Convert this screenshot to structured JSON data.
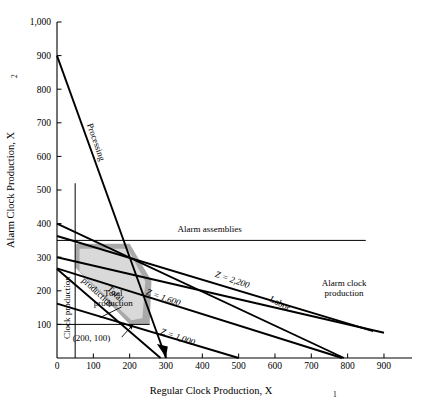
{
  "chart_data": {
    "type": "line",
    "title": "",
    "xlabel": "Regular Clock Production, X",
    "xlabel_sub": "1",
    "ylabel": "Alarm Clock Production, X",
    "ylabel_sub": "2",
    "xlim": [
      0,
      900
    ],
    "ylim": [
      0,
      1000
    ],
    "xticks": [
      "0",
      "100",
      "200",
      "300",
      "400",
      "500",
      "600",
      "700",
      "800",
      "900"
    ],
    "xtick_values": [
      0,
      100,
      200,
      300,
      400,
      500,
      600,
      700,
      800,
      900
    ],
    "yticks": [
      "100",
      "200",
      "300",
      "400",
      "500",
      "600",
      "700",
      "800",
      "900",
      "1,000"
    ],
    "ytick_values": [
      100,
      200,
      300,
      400,
      500,
      600,
      700,
      800,
      900,
      1000
    ],
    "grid": false,
    "legend": "none",
    "constraint_lines": [
      {
        "name": "processing",
        "label": "Processing",
        "points": [
          [
            0,
            900
          ],
          [
            300,
            0
          ]
        ],
        "label_x": 100,
        "label_y": 640,
        "rotation": 71,
        "style": "thick"
      },
      {
        "name": "alarm-assemblies",
        "label": "Alarm assemblies",
        "points": [
          [
            0,
            350
          ],
          [
            850,
            350
          ]
        ],
        "label_x": 420,
        "label_y": 375,
        "rotation": 0,
        "style": "thin"
      },
      {
        "name": "labor",
        "label": "Labor",
        "points": [
          [
            0,
            400
          ],
          [
            790,
            0
          ]
        ],
        "label_x": 610,
        "label_y": 155,
        "rotation": 27,
        "style": "thick"
      },
      {
        "name": "alarm-clock-production",
        "label": "Alarm clock production",
        "label_line1": "Alarm clock",
        "label_line2": "production",
        "points": [
          [
            0,
            300
          ],
          [
            900,
            75
          ]
        ],
        "label_x": 790,
        "label_y": 215,
        "rotation": 0,
        "style": "thick"
      },
      {
        "name": "clock-production",
        "label": "Clock production",
        "points": [
          [
            50,
            0
          ],
          [
            50,
            520
          ]
        ],
        "label_x": 36,
        "label_y": 150,
        "rotation": -90,
        "style": "thin"
      },
      {
        "name": "total-production",
        "label": "Total production",
        "label_line1": "Total",
        "label_line2": "production",
        "points": [
          [
            0,
            265
          ],
          [
            285,
            0
          ]
        ],
        "label_x": 155,
        "label_y": 185,
        "rotation": 43,
        "style": "thick"
      },
      {
        "name": "alarm-minimum",
        "label": "",
        "points": [
          [
            0,
            100
          ],
          [
            255,
            100
          ]
        ],
        "style": "thin"
      }
    ],
    "objective_lines": [
      {
        "name": "z-1000",
        "label": "Z = 1,000",
        "z_value": 1000,
        "points": [
          [
            0,
            162
          ],
          [
            500,
            0
          ]
        ],
        "label_x": 330,
        "label_y": 55,
        "rotation": 19
      },
      {
        "name": "z-1600",
        "label": "Z = 1,600",
        "z_value": 1600,
        "points": [
          [
            0,
            267
          ],
          [
            785,
            0
          ]
        ],
        "label_x": 290,
        "label_y": 172,
        "rotation": 19
      },
      {
        "name": "z-2200",
        "label": "Z = 2,200",
        "z_value": 2200,
        "points": [
          [
            0,
            363
          ],
          [
            870,
            80
          ]
        ],
        "label_x": 480,
        "label_y": 225,
        "rotation": 19
      }
    ],
    "feasible_region_outer": {
      "name": "feasible-region-outer",
      "fill_color": "#a9a9a9",
      "vertices": [
        [
          50,
          340
        ],
        [
          200,
          340
        ],
        [
          260,
          230
        ],
        [
          255,
          100
        ],
        [
          200,
          100
        ],
        [
          50,
          270
        ]
      ]
    },
    "feasible_region_inner": {
      "name": "feasible-region-inner",
      "fill_color": "#d9d9d9",
      "vertices": [
        [
          62,
          325
        ],
        [
          195,
          325
        ],
        [
          243,
          228
        ],
        [
          235,
          118
        ],
        [
          205,
          112
        ],
        [
          62,
          258
        ]
      ]
    },
    "annotations": [
      {
        "name": "optimal-point-label",
        "text": "(200, 100)",
        "x": 95,
        "y": 52,
        "point_x": 200,
        "point_y": 100
      }
    ]
  },
  "colors": {
    "line": "#000000",
    "background": "#ffffff",
    "region_outer": "#a9a9a9",
    "region_inner": "#d9d9d9"
  }
}
